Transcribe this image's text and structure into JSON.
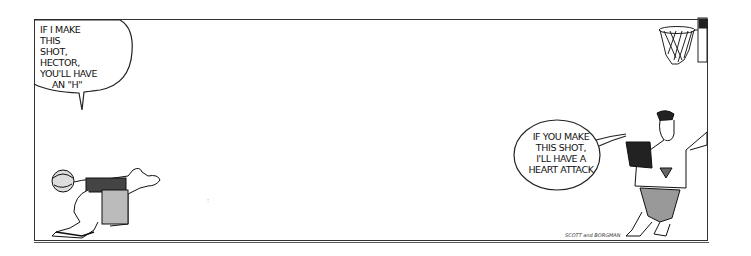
{
  "strip": {
    "title": "Zits",
    "panels": [
      {
        "balloons": [
          {
            "speaker": "Jeremy",
            "lines": [
              "IF I MAKE THIS",
              "SHOT, HECTOR,",
              "YOU'LL HAVE",
              "AN \"H\""
            ]
          },
          {
            "speaker": "Hector",
            "lines": [
              "IF YOU MAKE",
              "THIS SHOT,",
              "I'LL HAVE A",
              "HEART ATTACK"
            ]
          }
        ],
        "signature": "SCOTT and BORGMAN"
      }
    ]
  },
  "colors": {
    "ink": "#111111",
    "paper": "#ffffff",
    "border": "#333333"
  }
}
